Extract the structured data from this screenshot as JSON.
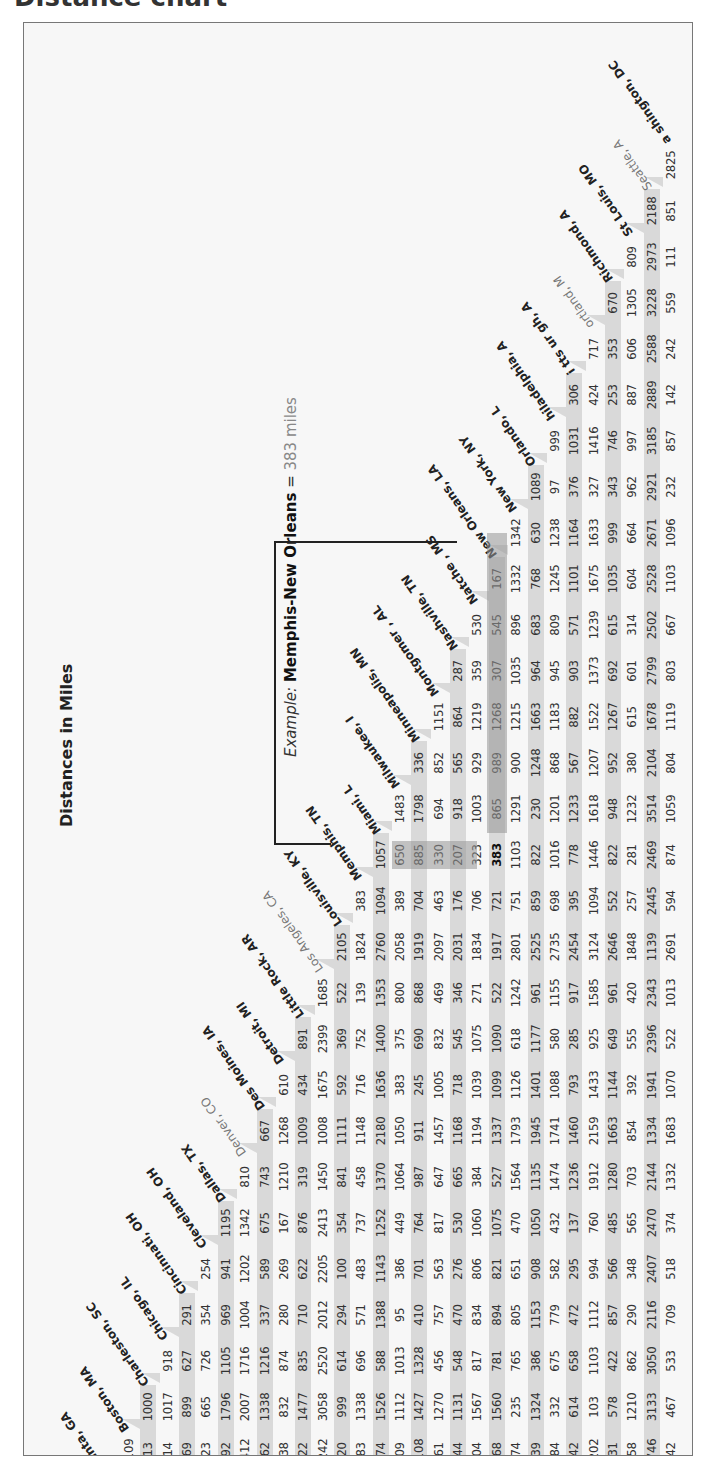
{
  "page": {
    "heading": "Distance chart"
  },
  "chart_data": {
    "type": "table",
    "title": "Distances in Miles",
    "annotation": {
      "prefix": "Example:",
      "pair": "Memphis-New Orleans",
      "equals": "=",
      "answer": "383 miles",
      "from": "Memphis, TN",
      "to": "New Orleans, LA",
      "value": 383
    },
    "cities": [
      "Atlanta, GA",
      "Boston, MA",
      "Charleston, SC",
      "Chicago, IL",
      "Cincinnati, OH",
      "Cleveland, OH",
      "Dallas, TX",
      "Denver, CO",
      "Des Moines, IA",
      "Detroit, MI",
      "Little Rock, AR",
      "Los Angeles, CA",
      "Louisville, KY",
      "Memphis, TN",
      "Miami, L",
      "Milwaukee, I",
      "Minneapolis, MN",
      "Montgomer , AL",
      "Nashville, TN",
      "Natche , MS",
      "New Orleans, LA",
      "New York, NY",
      "Orlando, L",
      "hiladelphia, A",
      "i tts ur gh, A",
      "ortland, M",
      "Richmond, A",
      "St Louis, MO",
      "Seattle, A",
      "a shington, DC"
    ],
    "faint_labels": [
      7,
      11,
      25,
      28
    ],
    "rows": [
      {
        "city": "Boston, MA",
        "values": [
          1109
        ]
      },
      {
        "city": "Charleston, SC",
        "values": [
          313,
          1000
        ]
      },
      {
        "city": "Chicago, IL",
        "values": [
          714,
          1017,
          918
        ]
      },
      {
        "city": "Cincinnati, OH",
        "values": [
          469,
          899,
          627,
          291
        ]
      },
      {
        "city": "Cleveland, OH",
        "values": [
          723,
          665,
          726,
          354,
          254
        ]
      },
      {
        "city": "Dallas, TX",
        "values": [
          792,
          1796,
          1105,
          969,
          941,
          1195
        ]
      },
      {
        "city": "Denver, CO",
        "values": [
          1412,
          2007,
          1716,
          1004,
          1202,
          1342,
          810
        ]
      },
      {
        "city": "Des Moines, IA",
        "values": [
          962,
          1338,
          1216,
          337,
          589,
          675,
          743,
          667
        ]
      },
      {
        "city": "Detroit, MI",
        "values": [
          738,
          832,
          874,
          280,
          269,
          167,
          1210,
          1268,
          610
        ]
      },
      {
        "city": "Little Rock, AR",
        "values": [
          522,
          1477,
          835,
          710,
          622,
          876,
          319,
          1009,
          434,
          891
        ]
      },
      {
        "city": "Los Angeles, CA",
        "values": [
          2242,
          3058,
          2520,
          2012,
          2205,
          2413,
          1450,
          1008,
          1675,
          2399,
          1685
        ]
      },
      {
        "city": "Louisville, KY",
        "values": [
          420,
          999,
          614,
          294,
          100,
          354,
          841,
          1111,
          592,
          369,
          522,
          2105
        ]
      },
      {
        "city": "Memphis, TN",
        "values": [
          383,
          1338,
          696,
          571,
          483,
          737,
          458,
          1148,
          716,
          752,
          139,
          1824,
          383
        ]
      },
      {
        "city": "Miami, FL",
        "values": [
          674,
          1526,
          588,
          1388,
          1143,
          1252,
          1370,
          2180,
          1636,
          1400,
          1353,
          2760,
          1094,
          1057
        ]
      },
      {
        "city": "Milwaukee, WI",
        "values": [
          809,
          1112,
          1013,
          95,
          386,
          449,
          1064,
          1050,
          383,
          375,
          800,
          2058,
          389,
          650,
          1483
        ]
      },
      {
        "city": "Minneapolis, MN",
        "values": [
          1108,
          1427,
          1328,
          410,
          701,
          764,
          987,
          911,
          245,
          690,
          868,
          1919,
          704,
          885,
          1798,
          336
        ]
      },
      {
        "city": "Montgomery, AL",
        "values": [
          161,
          1270,
          456,
          757,
          563,
          817,
          647,
          1457,
          1005,
          832,
          469,
          2097,
          463,
          330,
          694,
          852,
          1151
        ]
      },
      {
        "city": "Nashville, TN",
        "values": [
          244,
          1131,
          548,
          470,
          276,
          530,
          665,
          1168,
          718,
          545,
          346,
          2031,
          176,
          207,
          918,
          565,
          864,
          287
        ]
      },
      {
        "city": "Natchez, MS",
        "values": [
          504,
          1567,
          817,
          834,
          806,
          1060,
          384,
          1194,
          1039,
          1075,
          271,
          1834,
          706,
          323,
          1003,
          929,
          1219,
          359,
          530
        ]
      },
      {
        "city": "New Orleans, LA",
        "values": [
          468,
          1560,
          781,
          894,
          821,
          1075,
          527,
          1337,
          1099,
          1090,
          522,
          1917,
          721,
          383,
          865,
          989,
          1268,
          307,
          545,
          167
        ]
      },
      {
        "city": "New York, NY",
        "values": [
          874,
          235,
          765,
          805,
          651,
          470,
          1564,
          1793,
          1126,
          618,
          1242,
          2801,
          751,
          1103,
          1291,
          900,
          1215,
          1035,
          896,
          1332,
          1342
        ]
      },
      {
        "city": "Orlando, FL",
        "values": [
          439,
          1324,
          386,
          1153,
          908,
          1050,
          1135,
          1945,
          1401,
          1177,
          961,
          2525,
          859,
          822,
          230,
          1248,
          1663,
          964,
          683,
          768,
          630,
          1089
        ]
      },
      {
        "city": "Philadelphia, PA",
        "values": [
          784,
          332,
          675,
          779,
          582,
          432,
          1474,
          1741,
          1088,
          580,
          1155,
          2735,
          698,
          1016,
          1201,
          868,
          1183,
          945,
          809,
          1245,
          1238,
          97,
          999
        ]
      },
      {
        "city": "Pittsburgh, PA",
        "values": [
          742,
          614,
          658,
          472,
          295,
          137,
          1236,
          1460,
          793,
          285,
          917,
          2454,
          395,
          778,
          1233,
          567,
          882,
          903,
          571,
          1101,
          1164,
          376,
          1031,
          306
        ]
      },
      {
        "city": "Portland, ME",
        "values": [
          1202,
          103,
          1103,
          1112,
          994,
          760,
          1912,
          2159,
          1433,
          925,
          1585,
          3124,
          1094,
          1446,
          1618,
          1207,
          1522,
          1373,
          1239,
          1675,
          1633,
          327,
          1416,
          424,
          717
        ]
      },
      {
        "city": "Richmond, VA",
        "values": [
          531,
          578,
          422,
          857,
          566,
          485,
          1280,
          1663,
          1144,
          649,
          961,
          2646,
          552,
          822,
          948,
          952,
          1267,
          692,
          615,
          1035,
          999,
          343,
          746,
          253,
          353,
          670
        ]
      },
      {
        "city": "St Louis, MO",
        "values": [
          558,
          1210,
          862,
          290,
          348,
          565,
          703,
          854,
          392,
          555,
          420,
          1848,
          257,
          281,
          1232,
          380,
          615,
          601,
          314,
          604,
          664,
          962,
          997,
          887,
          606,
          1305,
          809
        ]
      },
      {
        "city": "Seattle, WA",
        "values": [
          2746,
          3133,
          3050,
          2116,
          2407,
          2470,
          2144,
          1334,
          1941,
          2396,
          2343,
          1139,
          2445,
          2469,
          3514,
          2104,
          1678,
          2799,
          2502,
          2528,
          2671,
          2921,
          3185,
          2889,
          2588,
          3228,
          2973,
          2188
        ]
      },
      {
        "city": "Washington, DC",
        "values": [
          642,
          467,
          533,
          709,
          518,
          374,
          1332,
          1683,
          1070,
          522,
          1013,
          2691,
          594,
          874,
          1059,
          804,
          1119,
          803,
          667,
          1103,
          1096,
          232,
          857,
          142,
          242,
          559,
          111,
          851,
          2825
        ]
      }
    ],
    "highlight": {
      "row": 19,
      "col": 13
    },
    "colors": {
      "stripe": "#d9d9d9",
      "arrow": "#999999",
      "text": "#333333",
      "border": "#777777"
    },
    "orientation": "rotated -90deg"
  }
}
